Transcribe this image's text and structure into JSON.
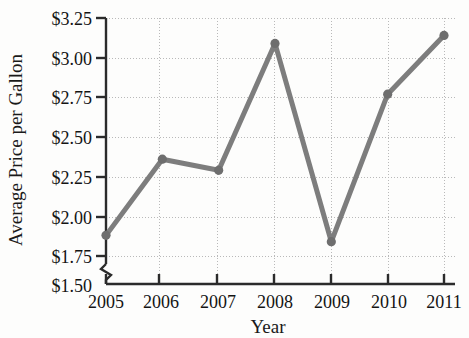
{
  "chart_data": {
    "type": "line",
    "title": "",
    "xlabel": "Year",
    "ylabel": "Average Price per Gallon",
    "categories": [
      "2005",
      "2006",
      "2007",
      "2008",
      "2009",
      "2010",
      "2011"
    ],
    "x": [
      2005,
      2006,
      2007,
      2008,
      2009,
      2010,
      2011
    ],
    "values": [
      1.88,
      2.36,
      2.29,
      3.09,
      1.84,
      2.77,
      3.14
    ],
    "series": [
      {
        "name": "Average Price per Gallon",
        "values": [
          1.88,
          2.36,
          2.29,
          3.09,
          1.84,
          2.77,
          3.14
        ]
      }
    ],
    "ytick_labels": [
      "$1.50",
      "$1.75",
      "$2.00",
      "$2.25",
      "$2.50",
      "$2.75",
      "$3.00",
      "$3.25"
    ],
    "ytick_values": [
      1.5,
      1.75,
      2.0,
      2.25,
      2.5,
      2.75,
      3.0,
      3.25
    ],
    "xtick_labels": [
      "2005",
      "2006",
      "2007",
      "2008",
      "2009",
      "2010",
      "2011"
    ],
    "ylim": [
      1.5,
      3.25
    ],
    "xlim": [
      2005,
      2011
    ],
    "grid": true,
    "legend": "none",
    "axis_break": true,
    "line_color": "#7d7d7d",
    "marker_color": "#6e6e6e",
    "marker": "circle",
    "gridline_color": "#b9b9b9",
    "axis_color": "#2b2b2b",
    "background_color": "#fdfdfc"
  }
}
